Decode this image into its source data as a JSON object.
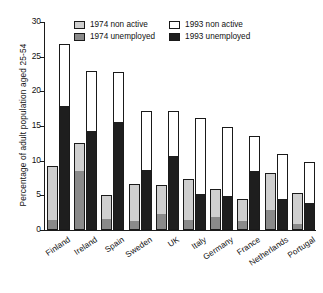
{
  "chart_data": {
    "type": "bar",
    "subtype": "grouped-stacked",
    "title": "",
    "xlabel": "",
    "ylabel": "Percentage of adult population aged 25-54",
    "ylim": [
      0,
      30
    ],
    "yticks": [
      0,
      5,
      10,
      15,
      20,
      25,
      30
    ],
    "grid": false,
    "legend_position": "top-center",
    "categories": [
      "Finland",
      "Ireland",
      "Spain",
      "Sweden",
      "UK",
      "Italy",
      "Germany",
      "France",
      "Netherlands",
      "Portugal"
    ],
    "series": [
      {
        "name": "1974 unemployed",
        "color": "#8a8a8a",
        "group": "1974",
        "stack_position": "bottom",
        "values": [
          1.3,
          8.4,
          1.5,
          1.1,
          2.1,
          1.3,
          1.7,
          1.1,
          2.8,
          0.7
        ]
      },
      {
        "name": "1974 non active",
        "color": "#cfcfcf",
        "group": "1974",
        "stack_position": "top",
        "values": [
          7.9,
          4.1,
          3.5,
          5.5,
          4.4,
          6.0,
          4.2,
          3.4,
          5.4,
          4.7
        ]
      },
      {
        "name": "1993 unemployed",
        "color": "#1e1e1e",
        "group": "1993",
        "stack_position": "bottom",
        "values": [
          17.8,
          14.1,
          15.5,
          8.5,
          10.5,
          5.1,
          4.8,
          8.4,
          4.4,
          3.7
        ]
      },
      {
        "name": "1993 non active",
        "color": "#ffffff",
        "group": "1993",
        "stack_position": "top",
        "values": [
          9.0,
          8.8,
          7.3,
          8.6,
          6.6,
          11.1,
          10.1,
          5.1,
          6.5,
          6.1
        ]
      }
    ],
    "totals": {
      "1974": [
        9.2,
        12.5,
        5.0,
        6.6,
        6.5,
        7.3,
        5.9,
        4.5,
        8.2,
        5.4
      ],
      "1993": [
        26.8,
        22.9,
        22.8,
        17.1,
        17.1,
        16.2,
        14.9,
        13.5,
        10.9,
        9.8
      ]
    }
  },
  "legend": {
    "items": [
      {
        "label": "1974 non active",
        "color": "#cfcfcf"
      },
      {
        "label": "1993 non active",
        "color": "#ffffff"
      },
      {
        "label": "1974 unemployed",
        "color": "#8a8a8a"
      },
      {
        "label": "1993 unemployed",
        "color": "#1e1e1e"
      }
    ]
  },
  "caption": {
    "text": ""
  }
}
